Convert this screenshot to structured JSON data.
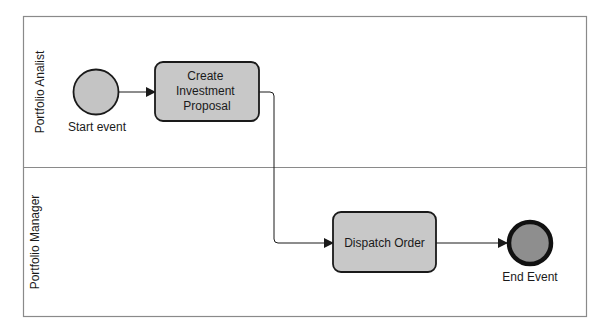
{
  "diagram": {
    "type": "BPMN process",
    "lanes": [
      {
        "id": "lane-1",
        "label": "Portfolio Analist"
      },
      {
        "id": "lane-2",
        "label": "Portfolio Manager"
      }
    ],
    "start_event": {
      "label": "Start event"
    },
    "tasks": [
      {
        "id": "task-1",
        "lines": [
          "Create",
          "Investment",
          "Proposal"
        ]
      },
      {
        "id": "task-2",
        "lines": [
          "Dispatch Order"
        ]
      }
    ],
    "end_event": {
      "label": "End Event"
    },
    "colors": {
      "pool_border": "#8a8a8a",
      "task_fill": "#c8c8c8",
      "start_fill": "#c4c4c4",
      "end_fill": "#8e8e8e",
      "stroke": "#1a1a1a"
    }
  }
}
